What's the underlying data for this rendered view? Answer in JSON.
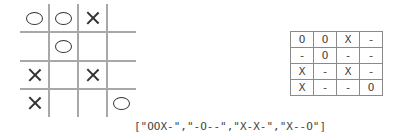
{
  "board": {
    "rows": [
      [
        "O",
        "O",
        "X",
        ""
      ],
      [
        "",
        "O",
        "",
        ""
      ],
      [
        "X",
        "",
        "X",
        ""
      ],
      [
        "X",
        "",
        "",
        "O"
      ]
    ]
  },
  "table": {
    "rows": [
      [
        "O",
        "O",
        "X",
        "-"
      ],
      [
        "-",
        "O",
        "-",
        "-"
      ],
      [
        "X",
        "-",
        "X",
        "-"
      ],
      [
        "X",
        "-",
        "-",
        "O"
      ]
    ]
  },
  "encoding": "[\"OOX-\",\"-O--\",\"X-X-\",\"X--O\"]",
  "colors": {
    "grid_line": "#a8a8a8",
    "mark": "#333333",
    "table_border": "#8a8a8a",
    "text": "#444444"
  }
}
